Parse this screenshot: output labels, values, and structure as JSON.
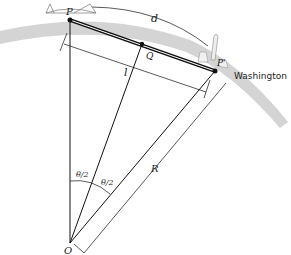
{
  "diagram": {
    "labels": {
      "P": "P",
      "P_prime": "P'",
      "Q": "Q",
      "d": "d",
      "l": "l",
      "R": "R",
      "O": "O",
      "theta_half_left": "θ/2",
      "theta_half_right": "θ/2",
      "city": "Washington"
    },
    "icons": [
      "bridge-icon",
      "washington-monument-icon",
      "capitol-icon"
    ],
    "colors": {
      "earth_band": "#d4d4d4",
      "line": "#111111",
      "tunnel": "#111111"
    }
  }
}
